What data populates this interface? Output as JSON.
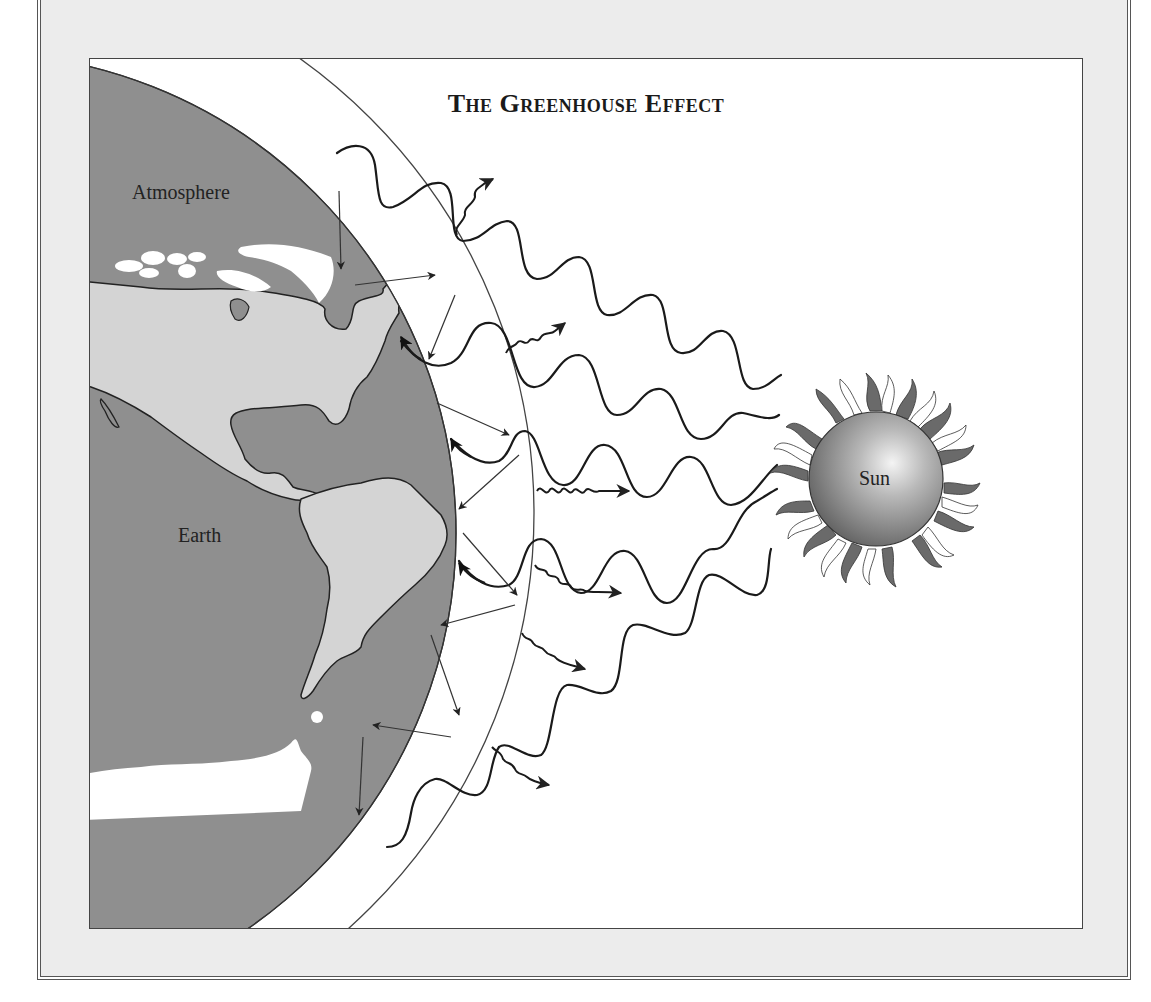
{
  "diagram": {
    "title": "The Greenhouse Effect",
    "labels": {
      "atmosphere": "Atmosphere",
      "earth": "Earth",
      "sun": "Sun"
    },
    "colors": {
      "ocean": "#8f8f8f",
      "land": "#d4d4d4",
      "ice": "#ffffff",
      "frame_background": "#ececec",
      "panel_background": "#ffffff",
      "line": "#222222"
    },
    "elements": {
      "incoming_solar_waves": 6,
      "escaping_infrared_squiggles": 6,
      "reflected_arrows_in_atmosphere": 12
    }
  }
}
